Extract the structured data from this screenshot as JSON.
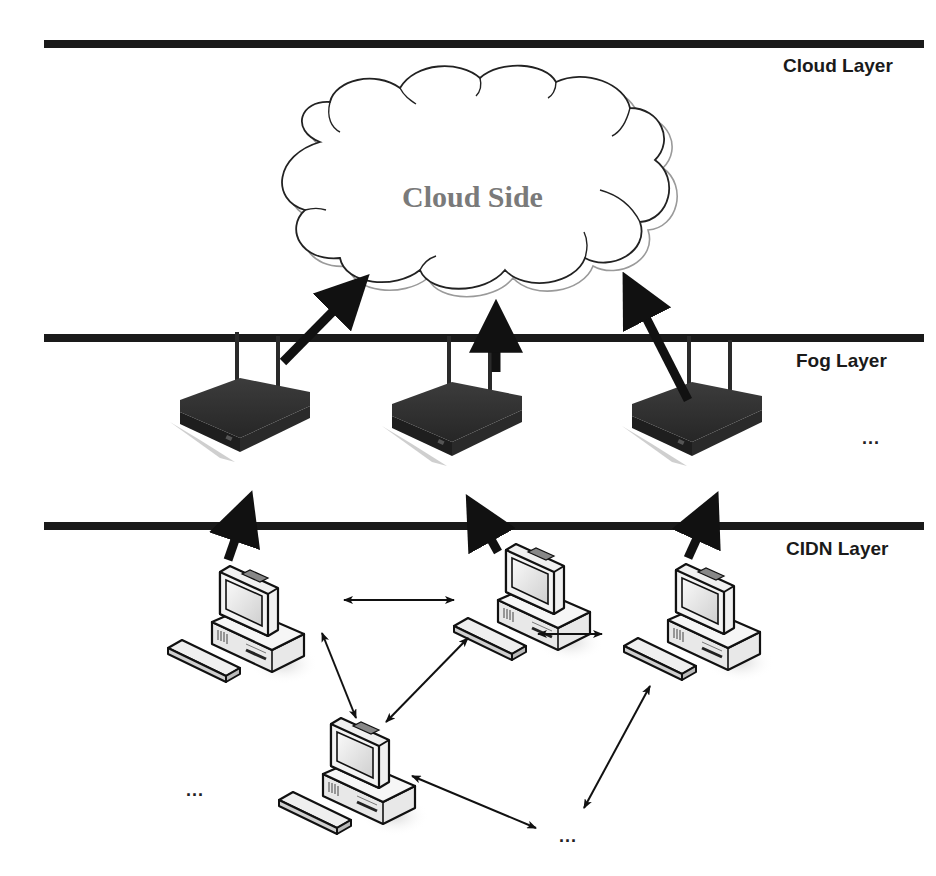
{
  "diagram": {
    "type": "fog-computing-architecture",
    "layers": [
      {
        "id": "cloud",
        "label": "Cloud Layer",
        "line_y": 44
      },
      {
        "id": "fog",
        "label": "Fog Layer",
        "line_y": 338
      },
      {
        "id": "cidn",
        "label": "CIDN Layer",
        "line_y": 526
      }
    ],
    "cloud": {
      "label": "Cloud Side"
    },
    "fog_nodes": [
      {
        "id": "router-1",
        "icon": "wireless-router-icon"
      },
      {
        "id": "router-2",
        "icon": "wireless-router-icon"
      },
      {
        "id": "router-3",
        "icon": "wireless-router-icon"
      }
    ],
    "fog_more": "...",
    "cidn_nodes": [
      {
        "id": "pc-1",
        "icon": "desktop-computer-icon"
      },
      {
        "id": "pc-2",
        "icon": "desktop-computer-icon"
      },
      {
        "id": "pc-3",
        "icon": "desktop-computer-icon"
      },
      {
        "id": "pc-4",
        "icon": "desktop-computer-icon"
      }
    ],
    "cidn_more_left": "...",
    "cidn_more_bottom": "...",
    "edges": [
      {
        "from": "router-1",
        "to": "cloud",
        "style": "thick-arrow"
      },
      {
        "from": "router-2",
        "to": "cloud",
        "style": "thick-arrow"
      },
      {
        "from": "router-3",
        "to": "cloud",
        "style": "thick-arrow"
      },
      {
        "from": "pc-1",
        "to": "router-1",
        "style": "thick-arrow"
      },
      {
        "from": "pc-2",
        "to": "router-2",
        "style": "thick-arrow"
      },
      {
        "from": "pc-3",
        "to": "router-3",
        "style": "thick-arrow"
      },
      {
        "from": "pc-1",
        "to": "pc-2",
        "style": "double-arrow"
      },
      {
        "from": "pc-2",
        "to": "pc-3",
        "style": "double-arrow"
      },
      {
        "from": "pc-1",
        "to": "pc-4",
        "style": "double-arrow"
      },
      {
        "from": "pc-2",
        "to": "pc-4",
        "style": "double-arrow"
      },
      {
        "from": "pc-4",
        "to": "more-bottom",
        "style": "double-arrow"
      },
      {
        "from": "pc-3",
        "to": "more-bottom",
        "style": "double-arrow"
      }
    ]
  },
  "colors": {
    "layer_line": "#1a1a1a",
    "router_body": "#2e2e2e",
    "router_top": "#3a3a3a",
    "router_shadow": "#c8c8c8",
    "cloud_text": "#7a7a7a",
    "cloud_outline": "#222222",
    "cloud_outline_secondary": "#9a9a9a"
  }
}
